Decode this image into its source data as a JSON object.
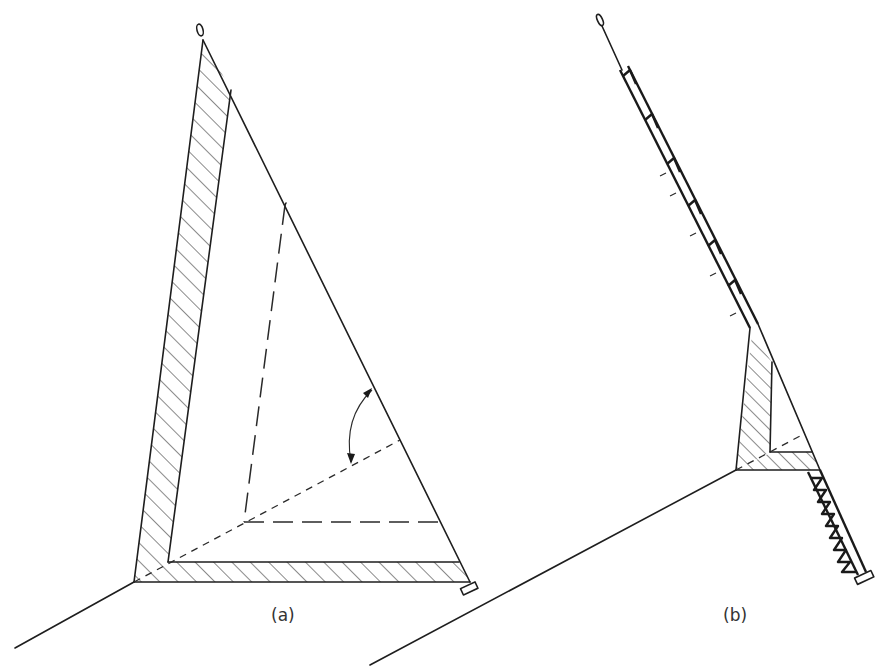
{
  "figure": {
    "panels": [
      {
        "id": "a",
        "label": "(a)"
      },
      {
        "id": "b",
        "label": "(b)"
      }
    ],
    "colors": {
      "line": "#1e1e1e",
      "background": "#ffffff"
    }
  }
}
